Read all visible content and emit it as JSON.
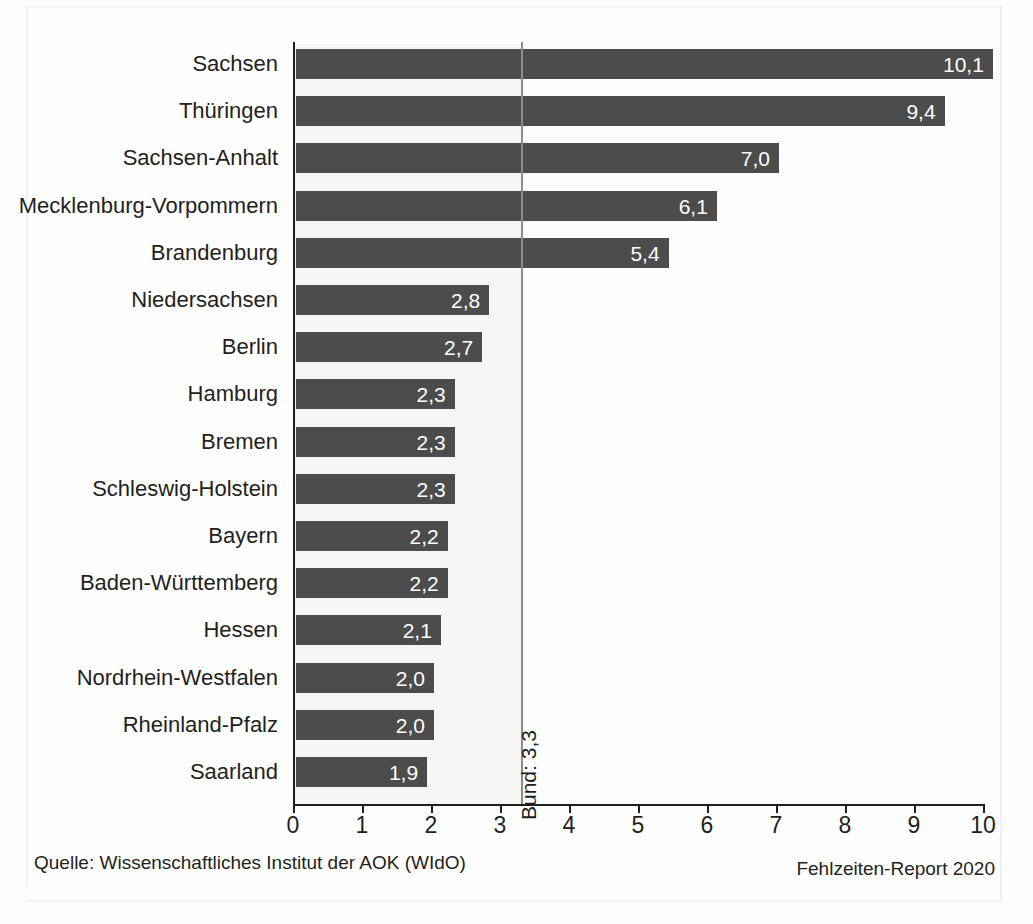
{
  "chart_data": {
    "type": "bar",
    "orientation": "horizontal",
    "title": "",
    "xlabel": "",
    "ylabel": "",
    "xlim": [
      0,
      10
    ],
    "grid": false,
    "legend": false,
    "decimal_separator": ",",
    "categories": [
      "Sachsen",
      "Thüringen",
      "Sachsen-Anhalt",
      "Mecklenburg-Vorpommern",
      "Brandenburg",
      "Niedersachsen",
      "Berlin",
      "Hamburg",
      "Bremen",
      "Schleswig-Holstein",
      "Bayern",
      "Baden-Württemberg",
      "Hessen",
      "Nordrhein-Westfalen",
      "Rheinland-Pfalz",
      "Saarland"
    ],
    "values": [
      10.1,
      9.4,
      7.0,
      6.1,
      5.4,
      2.8,
      2.7,
      2.3,
      2.3,
      2.3,
      2.2,
      2.2,
      2.1,
      2.0,
      2.0,
      1.9
    ],
    "value_labels": [
      "10,1",
      "9,4",
      "7,0",
      "6,1",
      "5,4",
      "2,8",
      "2,7",
      "2,3",
      "2,3",
      "2,3",
      "2,2",
      "2,2",
      "2,1",
      "2,0",
      "2,0",
      "1,9"
    ],
    "xticks": [
      0,
      1,
      2,
      3,
      4,
      5,
      6,
      7,
      8,
      9,
      10
    ],
    "xtick_labels": [
      "0",
      "1",
      "2",
      "3",
      "4",
      "5",
      "6",
      "7",
      "8",
      "9",
      "10"
    ],
    "reference_line": {
      "label": "Bund: 3,3",
      "value": 3.3
    },
    "colors": {
      "bar": "#4c4c4c",
      "bar_value_text": "#ffffff",
      "axis": "#231f20",
      "reference_line": "#8c8c8c",
      "background": "#fefefe",
      "band": "#f7f6f4"
    }
  },
  "footer": {
    "source": "Quelle: Wissenschaftliches Institut der AOK (WIdO)",
    "report": "Fehlzeiten-Report 2020"
  }
}
